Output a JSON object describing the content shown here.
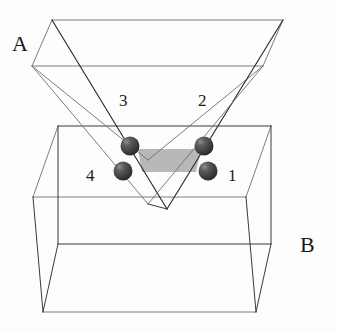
{
  "figure": {
    "background_color": "#fdfdfd",
    "line_color": "#3a3a3a",
    "line_color_light": "#6e6e6e",
    "line_color_dark": "#2b2b2b",
    "slab_color": "#b8b8b8",
    "sphere_color": "#4a4a4a",
    "sphere_highlight_color": "#9a9a9a",
    "sphere_shadow_color": "#2a2a2a"
  },
  "labels": {
    "prism_upper": "A",
    "prism_lower": "B",
    "points": [
      {
        "id": "1",
        "text": "1",
        "x": 228,
        "y": 181
      },
      {
        "id": "2",
        "text": "2",
        "x": 198,
        "y": 106
      },
      {
        "id": "3",
        "text": "3",
        "x": 119,
        "y": 106
      },
      {
        "id": "4",
        "text": "4",
        "x": 86,
        "y": 181
      }
    ],
    "prism_upper_pos": {
      "x": 12,
      "y": 51
    },
    "prism_lower_pos": {
      "x": 300,
      "y": 252
    }
  },
  "spheres": [
    {
      "id": "sphere-1",
      "label": "1",
      "cx": 208,
      "cy": 171,
      "r": 9.5
    },
    {
      "id": "sphere-2",
      "label": "2",
      "cx": 204,
      "cy": 146,
      "r": 9.5
    },
    {
      "id": "sphere-3",
      "label": "3",
      "cx": 130,
      "cy": 146,
      "r": 9.5
    },
    {
      "id": "sphere-4",
      "label": "4",
      "cx": 123,
      "cy": 171,
      "r": 9.5
    }
  ],
  "slab": {
    "name": "gray-slab",
    "points": "138,149 201,149 196,172 142,172",
    "color": "#b8b8b8"
  },
  "geometry": {
    "upper_prism": {
      "top_front_left": "52,20",
      "top_front_right": "283,20",
      "top_back_left": "32,66",
      "top_back_right": "263,66",
      "apex_front": "167,116",
      "apex_back": "148,160"
    },
    "lower_prism": {
      "top_front_left": "58,126",
      "top_front_right": "271,126",
      "top_back_left": "33,197",
      "top_back_right": "246,197",
      "bottom_front_left": "58,244",
      "bottom_front_right": "271,244",
      "bottom_back_left": "43,312",
      "bottom_back_right": "256,312"
    }
  }
}
